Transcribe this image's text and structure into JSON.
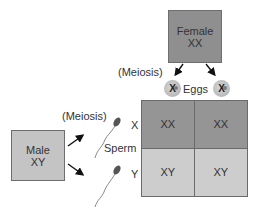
{
  "female": {
    "title": "Female",
    "genotype": "XX"
  },
  "male": {
    "title": "Male",
    "genotype": "XY"
  },
  "labels": {
    "meiosis_female": "(Meiosis)",
    "meiosis_male": "(Meiosis)",
    "eggs": "Eggs",
    "sperm": "Sperm"
  },
  "eggs": [
    {
      "chromosome": "X"
    },
    {
      "chromosome": "X"
    }
  ],
  "sperm": [
    {
      "chromosome": "X"
    },
    {
      "chromosome": "Y"
    }
  ],
  "punnett_grid": {
    "rows": [
      {
        "label": "X",
        "cells": [
          "XX",
          "XX"
        ]
      },
      {
        "label": "Y",
        "cells": [
          "XY",
          "XY"
        ]
      }
    ]
  },
  "colors": {
    "female_box": "#8f8f8f",
    "male_box": "#c4c4c4",
    "grid_top_row": "#959595",
    "grid_bottom_row": "#cdcdcd"
  }
}
